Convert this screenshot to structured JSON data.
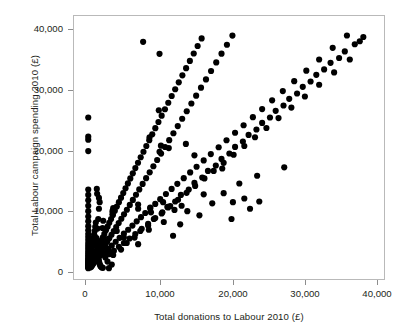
{
  "chart_data": {
    "type": "scatter",
    "title": "",
    "xlabel": "Total donations to Labour 2010 (£)",
    "ylabel": "Total Labour campaign spending 2010 (£)",
    "xlim": [
      -2000,
      41500
    ],
    "ylim": [
      -1800,
      42000
    ],
    "xticks": [
      0,
      10000,
      20000,
      30000,
      40000
    ],
    "xticklabels": [
      "0",
      "10,000",
      "20,000",
      "30,000",
      "40,000"
    ],
    "yticks": [
      0,
      10000,
      20000,
      30000,
      40000
    ],
    "yticklabels": [
      "0",
      "10,000",
      "20,000",
      "30,000",
      "40,000"
    ],
    "grid": false,
    "legend": null,
    "marker": {
      "shape": "circle",
      "color": "#000000",
      "size": 3.1
    },
    "frame_color": "#b9b9b9",
    "background": "#ffffff",
    "points": [
      [
        0,
        0
      ],
      [
        0,
        120
      ],
      [
        0,
        260
      ],
      [
        0,
        400
      ],
      [
        0,
        520
      ],
      [
        0,
        650
      ],
      [
        0,
        780
      ],
      [
        0,
        900
      ],
      [
        0,
        1050
      ],
      [
        0,
        1200
      ],
      [
        0,
        1400
      ],
      [
        0,
        1600
      ],
      [
        0,
        1850
      ],
      [
        0,
        2100
      ],
      [
        0,
        2400
      ],
      [
        0,
        2700
      ],
      [
        0,
        3050
      ],
      [
        0,
        3400
      ],
      [
        0,
        3800
      ],
      [
        0,
        4200
      ],
      [
        0,
        4700
      ],
      [
        0,
        5200
      ],
      [
        0,
        5700
      ],
      [
        0,
        6300
      ],
      [
        0,
        7000
      ],
      [
        0,
        7800
      ],
      [
        0,
        8600
      ],
      [
        0,
        9500
      ],
      [
        0,
        10400
      ],
      [
        0,
        11300
      ],
      [
        0,
        12200
      ],
      [
        0,
        13100
      ],
      [
        0,
        19500
      ],
      [
        0,
        21400
      ],
      [
        0,
        21900
      ],
      [
        0,
        25100
      ],
      [
        150,
        200
      ],
      [
        180,
        450
      ],
      [
        220,
        700
      ],
      [
        260,
        980
      ],
      [
        300,
        1250
      ],
      [
        340,
        1550
      ],
      [
        380,
        1900
      ],
      [
        420,
        2250
      ],
      [
        470,
        2650
      ],
      [
        520,
        3100
      ],
      [
        580,
        3600
      ],
      [
        640,
        4100
      ],
      [
        700,
        4600
      ],
      [
        760,
        5100
      ],
      [
        820,
        5600
      ],
      [
        900,
        6200
      ],
      [
        980,
        6900
      ],
      [
        1060,
        7600
      ],
      [
        1150,
        5000
      ],
      [
        1200,
        4400
      ],
      [
        1250,
        3700
      ],
      [
        1300,
        3000
      ],
      [
        1350,
        2450
      ],
      [
        1400,
        1950
      ],
      [
        1450,
        1500
      ],
      [
        1500,
        1150
      ],
      [
        1560,
        850
      ],
      [
        1620,
        600
      ],
      [
        1700,
        380
      ],
      [
        1800,
        220
      ],
      [
        1900,
        120
      ],
      [
        2050,
        60
      ],
      [
        260,
        130
      ],
      [
        330,
        330
      ],
      [
        410,
        560
      ],
      [
        500,
        820
      ],
      [
        610,
        1120
      ],
      [
        730,
        1450
      ],
      [
        860,
        1820
      ],
      [
        1000,
        2220
      ],
      [
        1150,
        2650
      ],
      [
        1310,
        3100
      ],
      [
        1480,
        3580
      ],
      [
        1660,
        4080
      ],
      [
        1850,
        4600
      ],
      [
        2050,
        5150
      ],
      [
        2260,
        5720
      ],
      [
        2480,
        6310
      ],
      [
        2710,
        6920
      ],
      [
        2950,
        7550
      ],
      [
        3200,
        8200
      ],
      [
        3460,
        8870
      ],
      [
        3730,
        9560
      ],
      [
        4010,
        10270
      ],
      [
        4300,
        11000
      ],
      [
        4600,
        11750
      ],
      [
        4910,
        12520
      ],
      [
        5230,
        13310
      ],
      [
        5560,
        14120
      ],
      [
        5900,
        14950
      ],
      [
        6250,
        15800
      ],
      [
        6610,
        16670
      ],
      [
        6980,
        17560
      ],
      [
        7360,
        18470
      ],
      [
        7750,
        19400
      ],
      [
        8150,
        20350
      ],
      [
        8560,
        21320
      ],
      [
        8980,
        22310
      ],
      [
        9410,
        23320
      ],
      [
        9850,
        24350
      ],
      [
        10300,
        25400
      ],
      [
        10760,
        26470
      ],
      [
        11230,
        27560
      ],
      [
        11710,
        28670
      ],
      [
        12200,
        29800
      ],
      [
        12700,
        30950
      ],
      [
        13210,
        32120
      ],
      [
        13730,
        33310
      ],
      [
        14260,
        34520
      ],
      [
        14800,
        35750
      ],
      [
        15350,
        37000
      ],
      [
        15910,
        38270
      ],
      [
        430,
        240
      ],
      [
        560,
        470
      ],
      [
        700,
        730
      ],
      [
        860,
        1020
      ],
      [
        1030,
        1340
      ],
      [
        1220,
        1690
      ],
      [
        1420,
        2070
      ],
      [
        1640,
        2480
      ],
      [
        1870,
        2920
      ],
      [
        2120,
        3390
      ],
      [
        2380,
        3890
      ],
      [
        2660,
        4420
      ],
      [
        2950,
        4980
      ],
      [
        3260,
        5570
      ],
      [
        3580,
        6190
      ],
      [
        3920,
        6840
      ],
      [
        4270,
        7520
      ],
      [
        4640,
        8230
      ],
      [
        5020,
        8970
      ],
      [
        5420,
        9740
      ],
      [
        5830,
        10540
      ],
      [
        6260,
        11370
      ],
      [
        6700,
        12230
      ],
      [
        7160,
        13120
      ],
      [
        7630,
        14040
      ],
      [
        8120,
        14990
      ],
      [
        8620,
        15970
      ],
      [
        9140,
        16980
      ],
      [
        9670,
        18020
      ],
      [
        10220,
        19090
      ],
      [
        10780,
        20190
      ],
      [
        11360,
        21320
      ],
      [
        11950,
        22480
      ],
      [
        12560,
        23670
      ],
      [
        13180,
        24890
      ],
      [
        13820,
        26140
      ],
      [
        14470,
        27420
      ],
      [
        15140,
        28730
      ],
      [
        15820,
        30070
      ],
      [
        16520,
        31440
      ],
      [
        17230,
        32840
      ],
      [
        17960,
        34270
      ],
      [
        18700,
        35730
      ],
      [
        19460,
        37220
      ],
      [
        20230,
        38740
      ],
      [
        2300,
        2450
      ],
      [
        2800,
        3100
      ],
      [
        3300,
        3750
      ],
      [
        3850,
        4400
      ],
      [
        4400,
        5050
      ],
      [
        5000,
        5750
      ],
      [
        5600,
        6400
      ],
      [
        6200,
        7100
      ],
      [
        6800,
        7800
      ],
      [
        7400,
        8500
      ],
      [
        8000,
        9200
      ],
      [
        8700,
        9950
      ],
      [
        9400,
        10700
      ],
      [
        10100,
        11500
      ],
      [
        10900,
        12350
      ],
      [
        11700,
        13200
      ],
      [
        12500,
        14050
      ],
      [
        13400,
        15000
      ],
      [
        14300,
        15950
      ],
      [
        15200,
        16900
      ],
      [
        16200,
        17950
      ],
      [
        17200,
        19000
      ],
      [
        18300,
        20150
      ],
      [
        19400,
        21300
      ],
      [
        20600,
        22550
      ],
      [
        21800,
        23800
      ],
      [
        23100,
        25150
      ],
      [
        24400,
        26500
      ],
      [
        25800,
        27950
      ],
      [
        27300,
        29500
      ],
      [
        28900,
        31150
      ],
      [
        30600,
        32900
      ],
      [
        32400,
        34750
      ],
      [
        34300,
        36700
      ],
      [
        36300,
        38750
      ],
      [
        2400,
        1800
      ],
      [
        3000,
        2350
      ],
      [
        3600,
        2900
      ],
      [
        4300,
        3550
      ],
      [
        5000,
        4200
      ],
      [
        5800,
        4950
      ],
      [
        6600,
        5700
      ],
      [
        7500,
        6550
      ],
      [
        8400,
        7400
      ],
      [
        9400,
        8350
      ],
      [
        10400,
        9300
      ],
      [
        11500,
        10350
      ],
      [
        12600,
        11400
      ],
      [
        13800,
        12550
      ],
      [
        15000,
        13700
      ],
      [
        16300,
        14950
      ],
      [
        17600,
        16200
      ],
      [
        19000,
        17550
      ],
      [
        20400,
        18900
      ],
      [
        21900,
        20350
      ],
      [
        23400,
        21800
      ],
      [
        25000,
        23350
      ],
      [
        26700,
        25000
      ],
      [
        28500,
        26750
      ],
      [
        30400,
        28600
      ],
      [
        32400,
        30550
      ],
      [
        34500,
        32600
      ],
      [
        36700,
        34750
      ],
      [
        38100,
        37800
      ],
      [
        38600,
        38500
      ],
      [
        37400,
        37300
      ],
      [
        36000,
        36100
      ],
      [
        35200,
        35000
      ],
      [
        34000,
        34200
      ],
      [
        33100,
        33100
      ],
      [
        32000,
        32200
      ],
      [
        31200,
        31100
      ],
      [
        30100,
        30200
      ],
      [
        29300,
        29100
      ],
      [
        28200,
        28200
      ],
      [
        27400,
        27100
      ],
      [
        26300,
        26200
      ],
      [
        25500,
        25100
      ],
      [
        24400,
        24200
      ],
      [
        23600,
        23100
      ],
      [
        22500,
        22200
      ],
      [
        21700,
        21100
      ],
      [
        20600,
        20200
      ],
      [
        19800,
        19100
      ],
      [
        18700,
        18200
      ],
      [
        17900,
        17100
      ],
      [
        16800,
        16200
      ],
      [
        16000,
        15100
      ],
      [
        14900,
        14200
      ],
      [
        14100,
        13100
      ],
      [
        13000,
        12200
      ],
      [
        12200,
        11100
      ],
      [
        11100,
        10200
      ],
      [
        10300,
        9100
      ],
      [
        9200,
        8200
      ],
      [
        8400,
        7100
      ],
      [
        7300,
        6200
      ],
      [
        6500,
        5100
      ],
      [
        5400,
        4200
      ],
      [
        4600,
        3100
      ],
      [
        3500,
        2200
      ],
      [
        2700,
        1100
      ],
      [
        7700,
        37700
      ],
      [
        10000,
        35700
      ],
      [
        9900,
        26300
      ],
      [
        8600,
        21800
      ],
      [
        10200,
        20400
      ],
      [
        10000,
        19400
      ],
      [
        11300,
        20000
      ],
      [
        13700,
        20700
      ],
      [
        14900,
        18800
      ],
      [
        3500,
        10000
      ],
      [
        3400,
        9500
      ],
      [
        3400,
        9000
      ],
      [
        7000,
        10600
      ],
      [
        7000,
        9900
      ],
      [
        8700,
        10100
      ],
      [
        8800,
        9300
      ],
      [
        10500,
        11000
      ],
      [
        11200,
        10100
      ],
      [
        12100,
        9700
      ],
      [
        13100,
        10400
      ],
      [
        13900,
        9500
      ],
      [
        12900,
        7300
      ],
      [
        10600,
        7700
      ],
      [
        8500,
        6400
      ],
      [
        7000,
        4000
      ],
      [
        5000,
        5100
      ],
      [
        4000,
        6200
      ],
      [
        2900,
        0
      ],
      [
        3300,
        600
      ],
      [
        19000,
        12500
      ],
      [
        20300,
        11000
      ],
      [
        21900,
        11600
      ],
      [
        22700,
        9900
      ],
      [
        20100,
        8200
      ],
      [
        23700,
        15400
      ],
      [
        24000,
        11100
      ],
      [
        21200,
        14100
      ],
      [
        18800,
        16600
      ],
      [
        27500,
        16800
      ],
      [
        16200,
        12300
      ],
      [
        17400,
        10800
      ],
      [
        15600,
        8800
      ],
      [
        11900,
        5400
      ],
      [
        1500,
        9900
      ],
      [
        1400,
        8200
      ],
      [
        1300,
        6600
      ],
      [
        1200,
        13200
      ],
      [
        1250,
        12400
      ],
      [
        1500,
        11700
      ],
      [
        1600,
        11000
      ],
      [
        900,
        5300
      ],
      [
        800,
        4500
      ],
      [
        700,
        3900
      ],
      [
        2200,
        5100
      ],
      [
        2400,
        4200
      ],
      [
        2600,
        3300
      ],
      [
        3100,
        2600
      ],
      [
        2000,
        6700
      ],
      [
        2100,
        7900
      ],
      [
        1900,
        2900
      ],
      [
        1700,
        2100
      ]
    ]
  }
}
